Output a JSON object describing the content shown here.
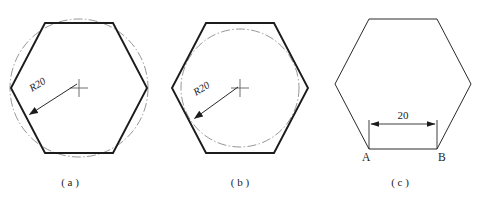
{
  "page": {
    "background_color": "#ffffff",
    "width": 491,
    "height": 198
  },
  "style_colors": {
    "outline_stroke": "#1c1c1c",
    "chain_line_stroke": "#8a8a8a",
    "center_mark_stroke": "#6e6e6e",
    "text_fill": "#1c1c1c"
  },
  "figures": [
    {
      "id": "figure-a",
      "caption": "( a )",
      "shape": "hexagon",
      "hexagon": {
        "orientation": "flat-top",
        "center_x": 79,
        "center_y": 88,
        "circumradius": 68,
        "line_weight": "bold"
      },
      "circle": {
        "kind": "circumscribed",
        "line_style": "dash-dot",
        "center_x": 79,
        "center_y": 88,
        "radius": 69
      },
      "center_mark": {
        "present": true,
        "x": 79,
        "y": 88,
        "arm": 9
      },
      "dimension": {
        "label": "R20",
        "label_x": 32,
        "label_y": 92,
        "leader_from_x": 77,
        "leader_from_y": 84,
        "leader_to_x": 27,
        "leader_to_y": 116,
        "arrow_at": "circle"
      }
    },
    {
      "id": "figure-b",
      "caption": "( b )",
      "shape": "hexagon",
      "hexagon": {
        "orientation": "flat-top",
        "center_x": 240,
        "center_y": 88,
        "circumradius": 68,
        "line_weight": "bold"
      },
      "circle": {
        "kind": "inscribed",
        "line_style": "dash-dot",
        "center_x": 240,
        "center_y": 88,
        "radius": 59
      },
      "center_mark": {
        "present": true,
        "x": 240,
        "y": 88,
        "arm": 9
      },
      "dimension": {
        "label": "R20",
        "label_x": 196,
        "label_y": 96,
        "leader_from_x": 238,
        "leader_from_y": 87,
        "leader_to_x": 192,
        "leader_to_y": 120,
        "arrow_at": "inscribed-circle"
      }
    },
    {
      "id": "figure-c",
      "caption": "( c )",
      "shape": "hexagon",
      "hexagon": {
        "orientation": "flat-top",
        "center_x": 403,
        "center_y": 84,
        "circumradius": 68,
        "line_weight": "thin"
      },
      "circle": {
        "kind": "none"
      },
      "center_mark": {
        "present": false
      },
      "dimension": {
        "label": "20",
        "label_x": 403,
        "label_y": 117,
        "line_y": 124,
        "left_x": 369,
        "right_x": 437,
        "arrow_style": "double-outward",
        "vertex_labels": [
          {
            "text": "A",
            "x": 365,
            "y": 158
          },
          {
            "text": "B",
            "x": 441,
            "y": 158
          }
        ]
      }
    }
  ],
  "captions": {
    "a": "( a )",
    "b": "( b )",
    "c": "( c )"
  },
  "labels": {
    "radius_a": "R20",
    "radius_b": "R20",
    "width_c": "20",
    "vertex_a": "A",
    "vertex_b": "B"
  },
  "caption_positions": {
    "a_x": 70,
    "a_y": 186,
    "b_x": 240,
    "b_y": 186,
    "c_x": 400,
    "c_y": 186
  }
}
